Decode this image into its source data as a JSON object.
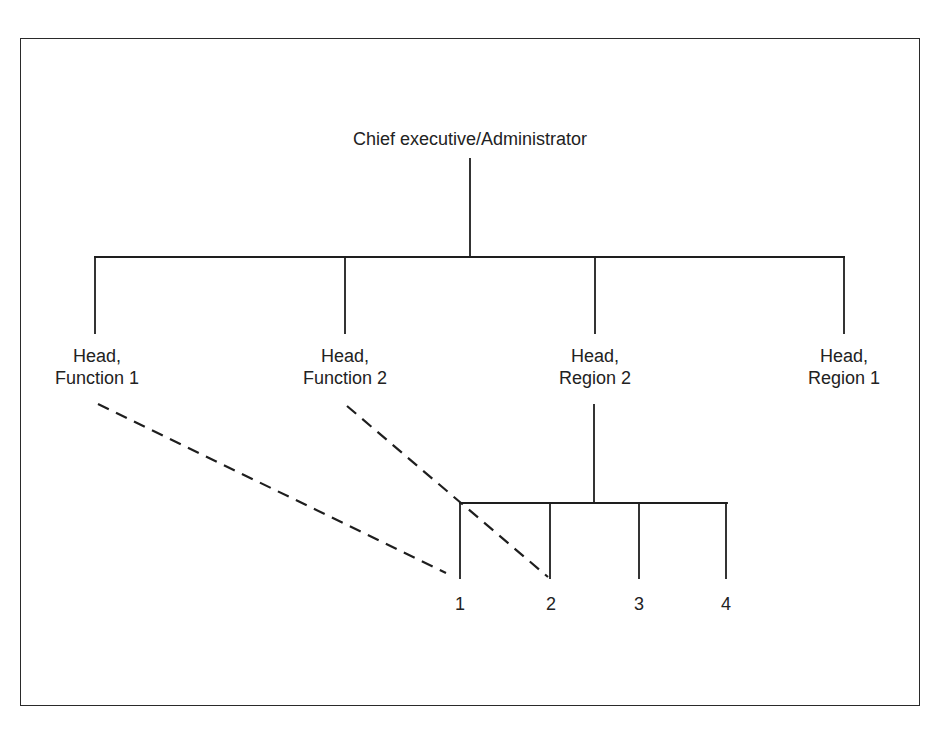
{
  "diagram": {
    "type": "organization-chart",
    "root": {
      "label": "Chief executive/Administrator"
    },
    "level1": [
      {
        "line1": "Head,",
        "line2": "Function 1",
        "x": 97
      },
      {
        "line1": "Head,",
        "line2": "Function 2",
        "x": 345
      },
      {
        "line1": "Head,",
        "line2": "Region 2",
        "x": 595
      },
      {
        "line1": "Head,",
        "line2": "Region 1",
        "x": 844
      }
    ],
    "level2_under_region2": [
      {
        "label": "1",
        "x": 460
      },
      {
        "label": "2",
        "x": 550
      },
      {
        "label": "3",
        "x": 639
      },
      {
        "label": "4",
        "x": 726
      }
    ],
    "solid_relationships": [
      {
        "from": "Chief executive/Administrator",
        "to": "Head, Function 1"
      },
      {
        "from": "Chief executive/Administrator",
        "to": "Head, Function 2"
      },
      {
        "from": "Chief executive/Administrator",
        "to": "Head, Region 2"
      },
      {
        "from": "Chief executive/Administrator",
        "to": "Head, Region 1"
      },
      {
        "from": "Head, Region 2",
        "to": "1"
      },
      {
        "from": "Head, Region 2",
        "to": "2"
      },
      {
        "from": "Head, Region 2",
        "to": "3"
      },
      {
        "from": "Head, Region 2",
        "to": "4"
      }
    ],
    "dashed_relationships": [
      {
        "from": "Head, Function 1",
        "to": "1"
      },
      {
        "from": "Head, Function 2",
        "to": "2"
      }
    ],
    "colors": {
      "line": "#1e1e1e",
      "background": "#ffffff"
    }
  }
}
